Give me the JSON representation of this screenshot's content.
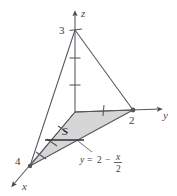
{
  "figure": {
    "type": "3d-coordinate-diagram",
    "background_color": "#ffffff",
    "line_color": "#4a4a52",
    "shade_color": "#d6d6d6",
    "axes": {
      "z": {
        "label": "z",
        "tick_labels": [
          "3"
        ],
        "ticks_shown": 3,
        "max_value": 3
      },
      "y": {
        "label": "y",
        "tick_labels": [
          "2"
        ],
        "ticks_shown": 2,
        "max_value": 2
      },
      "x": {
        "label": "x",
        "tick_labels": [
          "4"
        ],
        "ticks_shown": 4,
        "max_value": 4
      }
    },
    "region": {
      "label": "S",
      "description": "shaded-triangular-region"
    },
    "equation": {
      "lhs": "y",
      "equals": "=",
      "constant": "2",
      "minus": "−",
      "numerator": "x",
      "denominator": "2"
    },
    "vertices": {
      "origin": "0",
      "z_apex": "3",
      "y_intercept": "2",
      "x_intercept": "4"
    }
  }
}
